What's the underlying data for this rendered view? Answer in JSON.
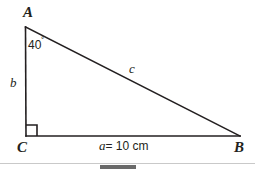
{
  "figure": {
    "type": "right-triangle-diagram",
    "background_color": "#ffffff",
    "stroke_color": "#231f20",
    "vertices": {
      "A": {
        "label": "A",
        "x": 25,
        "y": 27
      },
      "B": {
        "label": "B",
        "x": 240,
        "y": 136
      },
      "C": {
        "label": "C",
        "x": 26,
        "y": 136
      }
    },
    "sides": {
      "b": {
        "label": "b",
        "from": "A",
        "to": "C"
      },
      "c": {
        "label": "c",
        "from": "A",
        "to": "B"
      },
      "a": {
        "label": "a",
        "from": "C",
        "to": "B"
      }
    },
    "angle_at_A": {
      "value": "40",
      "degree_symbol": "˚",
      "full_label": "40˚"
    },
    "right_angle_at_C": {
      "marker": "square",
      "size_px": 11
    },
    "measurement": {
      "symbol": "a",
      "equals": "= 10 cm",
      "full_label": "a = 10 cm",
      "value": 10,
      "unit": "cm"
    }
  },
  "scrollbar": {
    "present": true,
    "orientation": "horizontal",
    "track_color": "#ffffff",
    "border_color": "#c9c9c9",
    "thumb_color": "#6a6a6a"
  }
}
